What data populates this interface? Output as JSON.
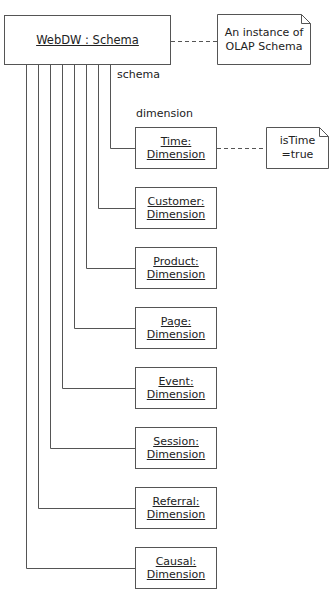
{
  "diagram": {
    "schema_object": {
      "label": "WebDW : Schema"
    },
    "schema_note": {
      "line1": "An instance of",
      "line2": "OLAP Schema"
    },
    "role_labels": {
      "schema": "schema",
      "dimension": "dimension"
    },
    "time_note": {
      "line1": "isTime",
      "line2": "=true"
    },
    "dimensions": [
      {
        "name": "Time:",
        "type": "Dimension"
      },
      {
        "name": "Customer:",
        "type": "Dimension"
      },
      {
        "name": "Product:",
        "type": "Dimension"
      },
      {
        "name": "Page:",
        "type": "Dimension"
      },
      {
        "name": "Event:",
        "type": "Dimension"
      },
      {
        "name": "Session:",
        "type": "Dimension"
      },
      {
        "name": "Referral:",
        "type": "Dimension"
      },
      {
        "name": "Causal:",
        "type": "Dimension"
      }
    ],
    "colors": {
      "line": "#555555",
      "background": "#ffffff",
      "text": "#222222"
    }
  }
}
